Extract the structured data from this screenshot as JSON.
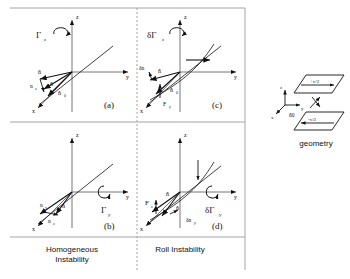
{
  "figure": {
    "panels": [
      {
        "id": "a",
        "tag": "(a)",
        "axes": {
          "z": "z",
          "y": "y",
          "x": "x"
        },
        "torque_label": "Γ",
        "torque_sub": "z",
        "vectors": [
          "ñ",
          "n̂",
          "n̂",
          "n̂"
        ],
        "vector_labels": [
          {
            "text": "ñ",
            "sub": ""
          },
          {
            "text": "n",
            "sub": "z"
          },
          {
            "text": "n̂",
            "sub": ""
          },
          {
            "text": "n̂",
            "sub": "0"
          }
        ]
      },
      {
        "id": "b",
        "tag": "(b)",
        "axes": {
          "z": "z",
          "y": "y",
          "x": "x"
        },
        "torque_label": "Γ",
        "torque_sub": "y",
        "vector_labels": [
          {
            "text": "n",
            "sub": "x"
          },
          {
            "text": "n",
            "sub": "z"
          },
          {
            "text": "n̂",
            "sub": ""
          }
        ],
        "caption_line1": "Homogeneous",
        "caption_line2": "Instability"
      },
      {
        "id": "c",
        "tag": "(c)",
        "axes": {
          "z": "z",
          "y": "y",
          "x": "x"
        },
        "torque_label": "δΓ",
        "torque_sub": "z",
        "vector_labels": [
          {
            "text": "δn",
            "sub": ""
          },
          {
            "text": "n̂",
            "sub": ""
          },
          {
            "text": "n̂",
            "sub": "0"
          },
          {
            "text": "F",
            "sub": "y"
          }
        ]
      },
      {
        "id": "d",
        "tag": "(d)",
        "axes": {
          "z": "z",
          "y": "y",
          "x": "x"
        },
        "torque_label": "δΓ",
        "torque_sub": "y",
        "vector_labels": [
          {
            "text": "F",
            "sub": "z"
          },
          {
            "text": "n̂",
            "sub": ""
          },
          {
            "text": "n̂",
            "sub": ""
          },
          {
            "text": "δn",
            "sub": "y"
          }
        ],
        "caption_line1": "Roll  Instability",
        "caption_line2": ""
      }
    ],
    "geometry": {
      "title": "geometry",
      "top_plate_velocity": "+v/2",
      "bottom_plate_velocity": "-v/2",
      "axis_z": "z",
      "axis_y": "y",
      "axis_x": "x",
      "director_label": "n̂0"
    },
    "colors": {
      "ink": "#111111",
      "rule": "#9a9a9a",
      "background": "#ffffff"
    }
  }
}
